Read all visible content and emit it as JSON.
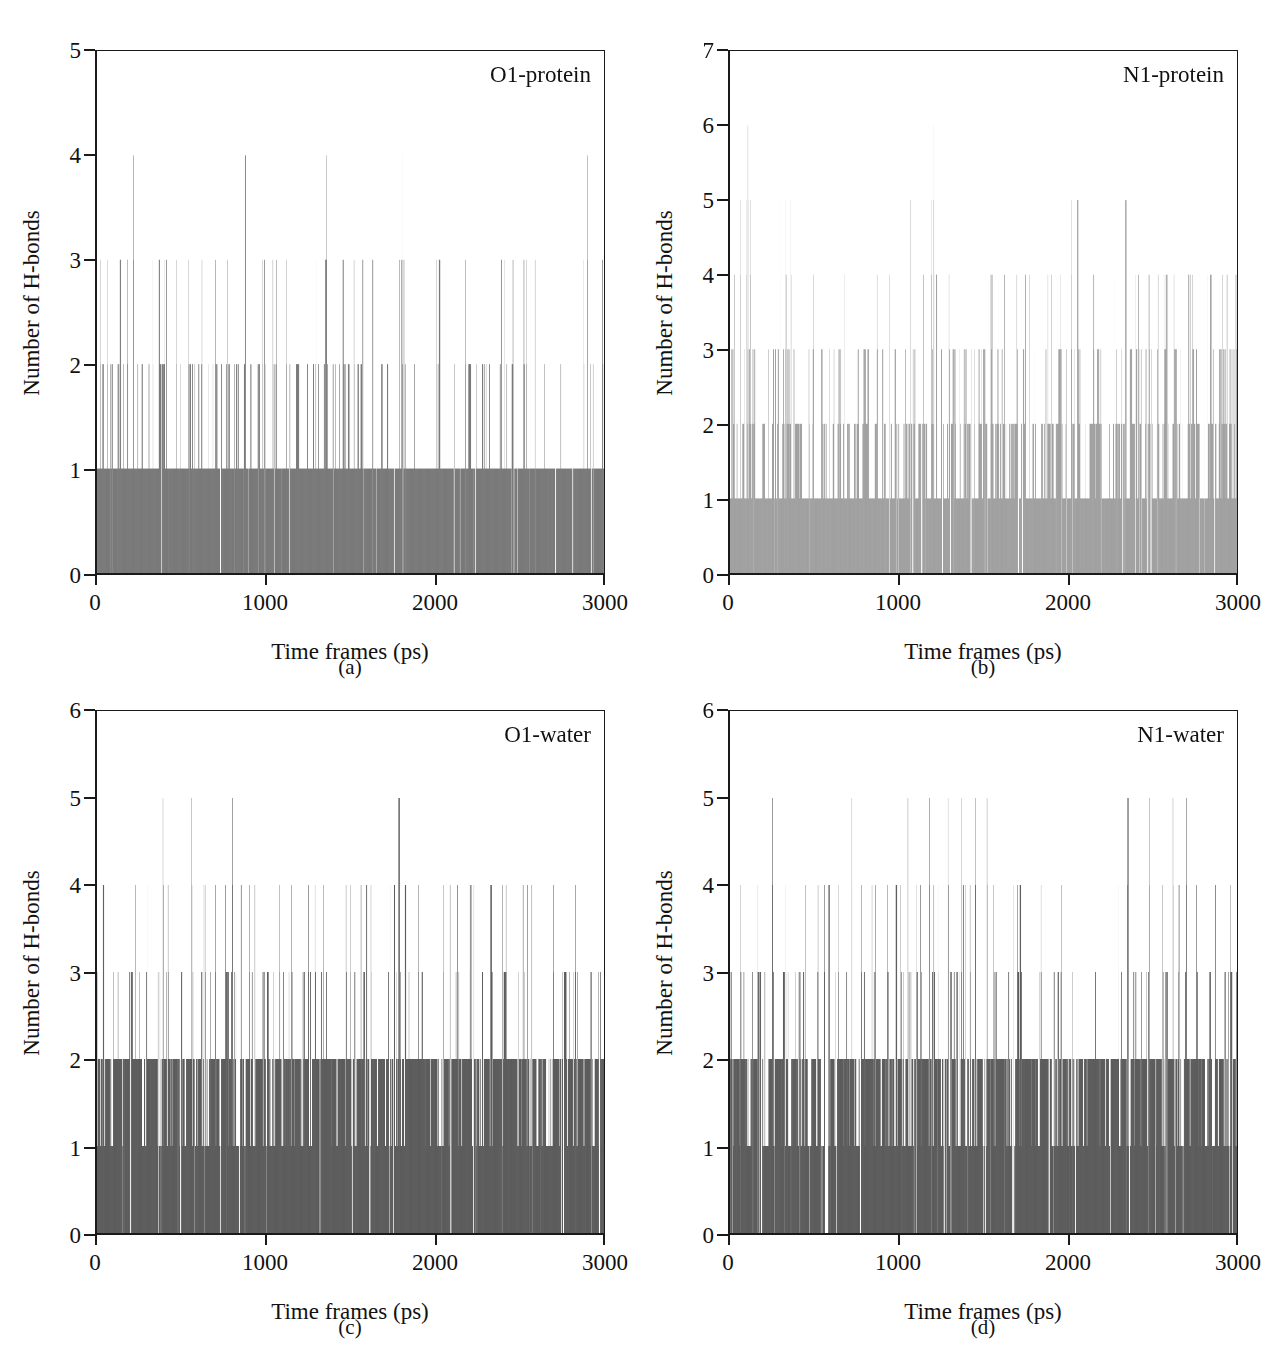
{
  "figure": {
    "xlabel": "Time frames (ps)",
    "ylabel": "Number of H-bonds",
    "xticks": [
      "0",
      "1000",
      "2000",
      "3000"
    ],
    "xlim": [
      0,
      3000
    ]
  },
  "panels": [
    {
      "caption": "(a)",
      "series_label": "O1-protein",
      "yticks": [
        "0",
        "1",
        "2",
        "3",
        "4",
        "5"
      ],
      "color": "#6a6a6a"
    },
    {
      "caption": "(b)",
      "series_label": "N1-protein",
      "yticks": [
        "0",
        "1",
        "2",
        "3",
        "4",
        "5",
        "6",
        "7"
      ],
      "color": "#969696"
    },
    {
      "caption": "(c)",
      "series_label": "O1-water",
      "yticks": [
        "0",
        "1",
        "2",
        "3",
        "4",
        "5",
        "6"
      ],
      "color": "#4a4a4a"
    },
    {
      "caption": "(d)",
      "series_label": "N1-water",
      "yticks": [
        "0",
        "1",
        "2",
        "3",
        "4",
        "5",
        "6"
      ],
      "color": "#4a4a4a"
    }
  ],
  "chart_data": [
    {
      "type": "line",
      "title": "O1-protein",
      "xlabel": "Time frames (ps)",
      "ylabel": "Number of H-bonds",
      "xlim": [
        0,
        3000
      ],
      "ylim": [
        0,
        5
      ],
      "yticks": [
        0,
        1,
        2,
        3,
        4,
        5
      ],
      "xticks": [
        0,
        1000,
        2000,
        3000
      ],
      "grid": false,
      "legend": "none",
      "n_frames": 3000,
      "description": "Per-frame count of hydrogen bonds between ligand atom O1 and the protein over a 3000 ps MD trajectory, drawn as dense vertical impulses.",
      "level_fraction": {
        "0": 0.1,
        "1": 0.62,
        "2": 0.24,
        "3": 0.035,
        "4": 0.005
      },
      "baseline_level": 1,
      "most_common_level": 1,
      "max_value": 4,
      "min_value": 0,
      "mean_value": 1.25,
      "spikes_to_4_near_ps": [
        215,
        1790,
        1810,
        2900
      ],
      "spikes_to_3_near_ps": [
        20,
        60,
        130,
        180,
        260,
        330,
        400,
        470,
        540,
        620,
        700,
        980,
        1040,
        1120,
        1300,
        1460,
        1520,
        1790,
        1805,
        1820,
        2010,
        2180,
        2460,
        2540,
        2880
      ],
      "color": "#6a6a6a"
    },
    {
      "type": "line",
      "title": "N1-protein",
      "xlabel": "Time frames (ps)",
      "ylabel": "Number of H-bonds",
      "xlim": [
        0,
        3000
      ],
      "ylim": [
        0,
        7
      ],
      "yticks": [
        0,
        1,
        2,
        3,
        4,
        5,
        6,
        7
      ],
      "xticks": [
        0,
        1000,
        2000,
        3000
      ],
      "grid": false,
      "legend": "none",
      "n_frames": 3000,
      "description": "Per-frame count of hydrogen bonds between ligand atom N1 and the protein; denser and higher on average than O1-protein, rendered in a lighter grey.",
      "level_fraction": {
        "0": 0.07,
        "1": 0.3,
        "2": 0.38,
        "3": 0.19,
        "4": 0.05,
        "5": 0.009,
        "6": 0.001
      },
      "baseline_level": 1,
      "most_common_level": 2,
      "max_value": 6,
      "min_value": 0,
      "mean_value": 2.05,
      "spikes_to_6_near_ps": [
        105,
        1200
      ],
      "spikes_to_5_near_ps": [
        60,
        95,
        120,
        300,
        330,
        360,
        1190,
        1205,
        2020
      ],
      "color": "#969696"
    },
    {
      "type": "line",
      "title": "O1-water",
      "xlabel": "Time frames (ps)",
      "ylabel": "Number of H-bonds",
      "xlim": [
        0,
        3000
      ],
      "ylim": [
        0,
        6
      ],
      "yticks": [
        0,
        1,
        2,
        3,
        4,
        5,
        6
      ],
      "xticks": [
        0,
        1000,
        2000,
        3000
      ],
      "grid": false,
      "legend": "none",
      "n_frames": 3000,
      "description": "Per-frame count of hydrogen bonds between ligand atom O1 and surrounding water molecules; nearly saturated at levels 1-2 across the whole trajectory.",
      "level_fraction": {
        "0": 0.06,
        "1": 0.33,
        "2": 0.46,
        "3": 0.12,
        "4": 0.027,
        "5": 0.003
      },
      "baseline_level": 2,
      "most_common_level": 2,
      "max_value": 5,
      "min_value": 0,
      "mean_value": 1.78,
      "spikes_to_5_near_ps": [
        390,
        560,
        800,
        2520
      ],
      "spikes_to_4_near_ps": [
        300,
        420,
        640,
        700,
        760,
        900,
        1080,
        1150,
        1250,
        1290,
        1340,
        1500,
        1620,
        1760,
        1900,
        2050,
        2200,
        2420,
        2520,
        2700,
        2830
      ],
      "color": "#4a4a4a"
    },
    {
      "type": "line",
      "title": "N1-water",
      "xlabel": "Time frames (ps)",
      "ylabel": "Number of H-bonds",
      "xlim": [
        0,
        3000
      ],
      "ylim": [
        0,
        6
      ],
      "yticks": [
        0,
        1,
        2,
        3,
        4,
        5,
        6
      ],
      "xticks": [
        0,
        1000,
        2000,
        3000
      ],
      "grid": false,
      "legend": "none",
      "n_frames": 3000,
      "description": "Per-frame count of hydrogen bonds between ligand atom N1 and surrounding water molecules; similar to O1-water but with visible low-occupancy gaps near 2000-2300 ps.",
      "level_fraction": {
        "0": 0.09,
        "1": 0.35,
        "2": 0.4,
        "3": 0.13,
        "4": 0.028,
        "5": 0.002
      },
      "baseline_level": 2,
      "most_common_level": 2,
      "max_value": 5,
      "min_value": 0,
      "mean_value": 1.74,
      "spikes_to_5_near_ps": [
        250,
        720,
        1180,
        1290,
        1370,
        1450,
        1520,
        2350,
        2480,
        2620,
        2700
      ],
      "spikes_to_4_near_ps": [
        60,
        160,
        330,
        520,
        640,
        860,
        930,
        1010,
        1100,
        1230,
        1420,
        1560,
        1700,
        1840,
        1960,
        2300,
        2560,
        2760,
        2960
      ],
      "color": "#4a4a4a"
    }
  ]
}
